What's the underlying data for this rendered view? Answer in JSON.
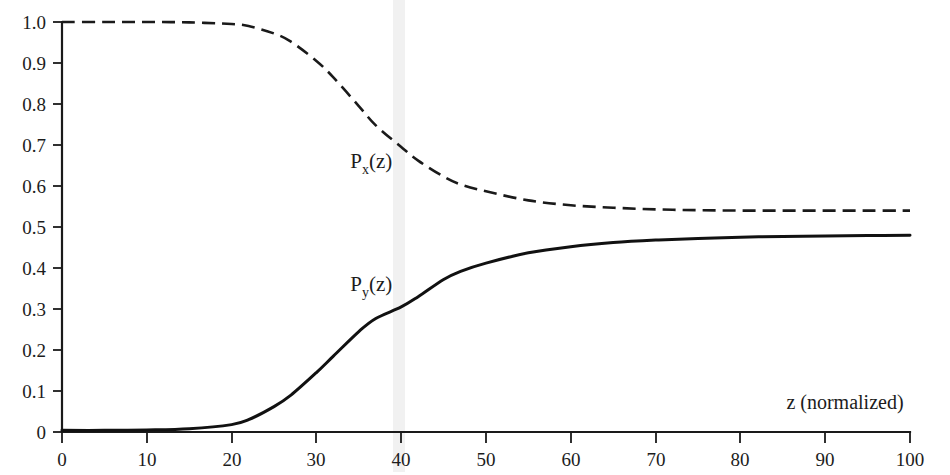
{
  "figure": {
    "background_color": "#ffffff",
    "ink_color": "#1a1a1a"
  },
  "axes": {
    "x_title": "z (normalized)",
    "y_title": "",
    "x_ticks": [
      "0",
      "10",
      "20",
      "30",
      "40",
      "50",
      "60",
      "70",
      "80",
      "90",
      "100"
    ],
    "y_ticks": [
      "0",
      "0.1",
      "0.2",
      "0.3",
      "0.4",
      "0.5",
      "0.6",
      "0.7",
      "0.8",
      "0.9",
      "1.0"
    ]
  },
  "annotations": {
    "px_base": "P",
    "px_sub": "x",
    "px_tail": "(z)",
    "py_base": "P",
    "py_sub": "y",
    "py_tail": "(z)"
  },
  "chart_data": {
    "type": "line",
    "title": "",
    "xlabel": "z (normalized)",
    "ylabel": "",
    "xlim": [
      0,
      100
    ],
    "ylim": [
      0,
      1.0
    ],
    "xticks": [
      0,
      10,
      20,
      30,
      40,
      50,
      60,
      70,
      80,
      90,
      100
    ],
    "yticks": [
      0,
      0.1,
      0.2,
      0.3,
      0.4,
      0.5,
      0.6,
      0.7,
      0.8,
      0.9,
      1.0
    ],
    "grid": false,
    "legend": "inline-labels",
    "x": [
      0,
      5,
      10,
      15,
      20,
      22,
      25,
      27,
      30,
      32,
      35,
      37,
      40,
      42,
      45,
      47,
      50,
      55,
      60,
      65,
      70,
      75,
      80,
      85,
      90,
      95,
      100
    ],
    "series": [
      {
        "name": "P_x(z)",
        "label": "Px(z)",
        "style": "dashed",
        "color": "#1a1a1a",
        "values": [
          1.0,
          1.0,
          1.0,
          0.999,
          0.995,
          0.99,
          0.972,
          0.952,
          0.905,
          0.865,
          0.795,
          0.748,
          0.695,
          0.662,
          0.623,
          0.604,
          0.587,
          0.565,
          0.553,
          0.547,
          0.543,
          0.541,
          0.54,
          0.54,
          0.54,
          0.54,
          0.54
        ],
        "annotation": {
          "text": "Px(z)",
          "x": 34,
          "y": 0.645
        }
      },
      {
        "name": "P_y(z)",
        "label": "Py(z)",
        "style": "solid",
        "color": "#111111",
        "values": [
          0.004,
          0.004,
          0.005,
          0.008,
          0.018,
          0.03,
          0.062,
          0.09,
          0.145,
          0.185,
          0.245,
          0.277,
          0.305,
          0.33,
          0.372,
          0.392,
          0.412,
          0.437,
          0.452,
          0.462,
          0.468,
          0.472,
          0.475,
          0.477,
          0.478,
          0.479,
          0.48
        ],
        "annotation": {
          "text": "Py(z)",
          "x": 34,
          "y": 0.345
        }
      }
    ]
  }
}
